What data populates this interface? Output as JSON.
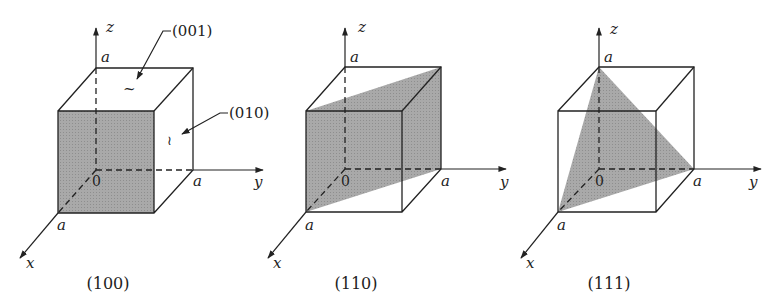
{
  "figure": {
    "shade_color": "#a6a6a6",
    "line_color": "#222222"
  },
  "panels": [
    {
      "caption": "(100)",
      "axes": {
        "x": "x",
        "y": "y",
        "z": "z",
        "origin": "0"
      },
      "intercepts": {
        "x": "a",
        "y": "a",
        "z": "a"
      },
      "annotations": [
        {
          "label": "(001)",
          "marker": "~"
        },
        {
          "label": "(010)",
          "marker": "≀"
        }
      ]
    },
    {
      "caption": "(110)",
      "axes": {
        "x": "x",
        "y": "y",
        "z": "z",
        "origin": "0"
      },
      "intercepts": {
        "x": "a",
        "y": "a",
        "z": "a"
      }
    },
    {
      "caption": "(111)",
      "axes": {
        "x": "x",
        "y": "y",
        "z": "z",
        "origin": "0"
      },
      "intercepts": {
        "x": "a",
        "y": "a",
        "z": "a"
      }
    }
  ]
}
